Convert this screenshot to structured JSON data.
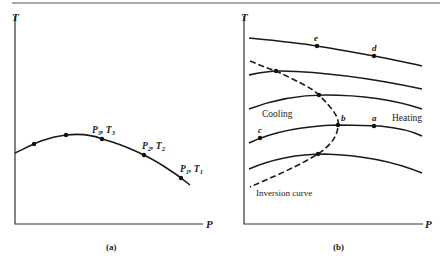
{
  "figure": {
    "top_rule": true,
    "panel_a": {
      "caption": "(a)",
      "y_axis_label": "T",
      "x_axis_label": "P",
      "point_labels": {
        "p3_sym": "P",
        "p3_sub": "3",
        "t3_sym": "T",
        "t3_sub": "3",
        "p2_sym": "P",
        "p2_sub": "2",
        "t2_sym": "T",
        "t2_sub": "2",
        "p1_sym": "P",
        "p1_sub": "1",
        "t1_sym": "T",
        "t1_sub": "1",
        "sep": ", "
      }
    },
    "panel_b": {
      "caption": "(b)",
      "y_axis_label": "T",
      "x_axis_label": "P",
      "region_cooling": "Cooling",
      "region_heating": "Heating",
      "inversion_label": "Inversion curve",
      "points": {
        "a": "a",
        "b": "b",
        "c": "c",
        "d": "d",
        "e": "e"
      }
    }
  }
}
